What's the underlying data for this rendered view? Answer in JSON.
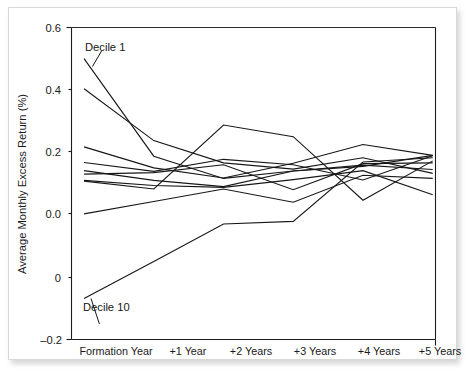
{
  "figure": {
    "background_color": "#ffffff",
    "frame_color": "#d8d8d8",
    "line_color": "#171717"
  },
  "annotations": {
    "top_label": "Decile 1",
    "bottom_label": "Decile 10"
  },
  "axis": {
    "y_title": "Average Monthly Excess Return (%)",
    "y_tick_labels": [
      "0.6",
      "0.4",
      "0.2",
      "0.0",
      "0",
      "–0.2"
    ],
    "x_tick_labels": [
      "Formation Year",
      "+1 Year",
      "+2 Years",
      "+3 Years",
      "+4 Years",
      "+5 Years"
    ]
  },
  "chart_data": {
    "type": "line",
    "title": "",
    "xlabel": "",
    "ylabel": "Average Monthly Excess Return (%)",
    "categories": [
      "Formation Year",
      "+1 Year",
      "+2 Years",
      "+3 Years",
      "+4 Years",
      "+5 Years"
    ],
    "x": [
      0,
      1,
      2,
      3,
      4,
      5
    ],
    "ylim": [
      -0.2,
      0.6
    ],
    "xlim": [
      -0.18,
      5.04
    ],
    "y_ticks": [
      0.6,
      0.4,
      0.2,
      0.0,
      -0.1,
      -0.2
    ],
    "y_tick_text": [
      "0.6",
      "0.4",
      "0.2",
      "0.0",
      "0",
      "–0.2"
    ],
    "grid": false,
    "legend": "none",
    "annotations": [
      {
        "text": "Decile 1",
        "x": 0.05,
        "y": 0.555,
        "points_to": [
          0.12,
          0.5
        ]
      },
      {
        "text": "Decile 10",
        "x": 0.02,
        "y": -0.145,
        "points_to": [
          0.1,
          -0.095
        ]
      }
    ],
    "series": [
      {
        "name": "Decile 1",
        "values": [
          0.52,
          0.27,
          0.213,
          0.232,
          0.244,
          0.272
        ]
      },
      {
        "name": "Decile 2",
        "values": [
          0.443,
          0.31,
          0.253,
          0.237,
          0.266,
          0.226
        ]
      },
      {
        "name": "Decile 3",
        "values": [
          0.294,
          0.24,
          0.214,
          0.252,
          0.3,
          0.272
        ]
      },
      {
        "name": "Decile 4",
        "values": [
          0.254,
          0.231,
          0.262,
          0.248,
          0.209,
          0.271
        ]
      },
      {
        "name": "Decile 5",
        "values": [
          0.233,
          0.208,
          0.192,
          0.232,
          0.247,
          0.236
        ]
      },
      {
        "name": "Decile 6",
        "values": [
          0.224,
          0.228,
          0.248,
          0.184,
          0.251,
          0.253
        ]
      },
      {
        "name": "Decile 7",
        "values": [
          0.208,
          0.195,
          0.19,
          0.21,
          0.233,
          0.171
        ]
      },
      {
        "name": "Decile 8",
        "values": [
          0.206,
          0.186,
          0.35,
          0.32,
          0.157,
          0.258
        ]
      },
      {
        "name": "Decile 9",
        "values": [
          0.122,
          0.154,
          0.186,
          0.152,
          0.221,
          0.213
        ]
      },
      {
        "name": "Decile 10",
        "values": [
          -0.095,
          0.0,
          0.096,
          0.103,
          0.255,
          0.266
        ]
      }
    ]
  }
}
